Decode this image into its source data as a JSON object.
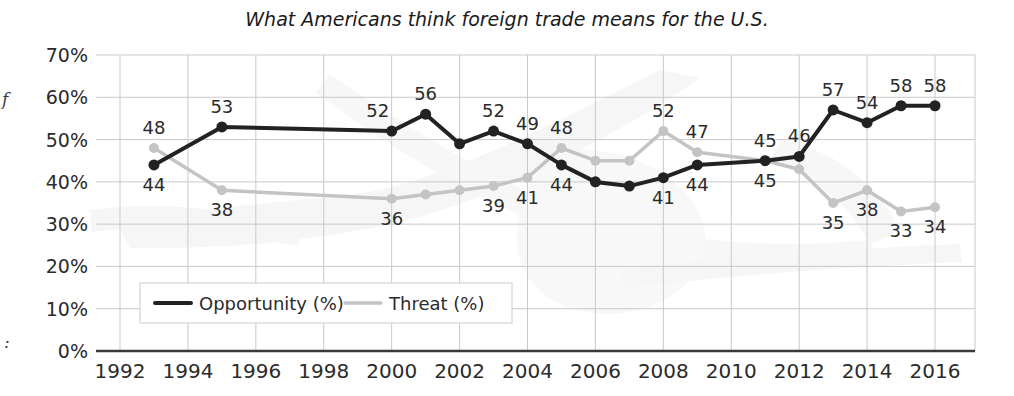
{
  "chart_data": {
    "type": "line",
    "title": "What Americans think foreign trade means for the U.S.",
    "xlabel": "",
    "ylabel": "",
    "xlim": [
      1992,
      2016
    ],
    "ylim": [
      0,
      70
    ],
    "grid": true,
    "legend_position": "bottom-left",
    "y_ticks": [
      "0%",
      "10%",
      "20%",
      "30%",
      "40%",
      "50%",
      "60%",
      "70%"
    ],
    "y_tick_values": [
      0,
      10,
      20,
      30,
      40,
      50,
      60,
      70
    ],
    "x_ticks": [
      "1992",
      "1994",
      "1996",
      "1998",
      "2000",
      "2002",
      "2004",
      "2006",
      "2008",
      "2010",
      "2012",
      "2014",
      "2016"
    ],
    "x_tick_values": [
      1992,
      1994,
      1996,
      1998,
      2000,
      2002,
      2004,
      2006,
      2008,
      2010,
      2012,
      2014,
      2016
    ],
    "series": [
      {
        "name": "Opportunity (%)",
        "color": "#222222",
        "points": [
          {
            "x": 1993,
            "y": 44,
            "label": "44",
            "label_pos": "below"
          },
          {
            "x": 1995,
            "y": 53,
            "label": "53",
            "label_pos": "above"
          },
          {
            "x": 2000,
            "y": 52,
            "label": "52",
            "label_pos": "above-left"
          },
          {
            "x": 2001,
            "y": 56,
            "label": "56",
            "label_pos": "above"
          },
          {
            "x": 2002,
            "y": 49,
            "label": "",
            "label_pos": "none"
          },
          {
            "x": 2003,
            "y": 52,
            "label": "52",
            "label_pos": "above"
          },
          {
            "x": 2004,
            "y": 49,
            "label": "49",
            "label_pos": "above"
          },
          {
            "x": 2005,
            "y": 44,
            "label": "44",
            "label_pos": "below"
          },
          {
            "x": 2006,
            "y": 40,
            "label": "",
            "label_pos": "none"
          },
          {
            "x": 2007,
            "y": 39,
            "label": "",
            "label_pos": "none"
          },
          {
            "x": 2008,
            "y": 41,
            "label": "41",
            "label_pos": "below"
          },
          {
            "x": 2009,
            "y": 44,
            "label": "44",
            "label_pos": "below"
          },
          {
            "x": 2011,
            "y": 45,
            "label": "45",
            "label_pos": "below"
          },
          {
            "x": 2012,
            "y": 46,
            "label": "46",
            "label_pos": "above"
          },
          {
            "x": 2013,
            "y": 57,
            "label": "57",
            "label_pos": "above"
          },
          {
            "x": 2014,
            "y": 54,
            "label": "54",
            "label_pos": "above"
          },
          {
            "x": 2015,
            "y": 58,
            "label": "58",
            "label_pos": "above"
          },
          {
            "x": 2016,
            "y": 58,
            "label": "58",
            "label_pos": "above"
          }
        ]
      },
      {
        "name": "Threat (%)",
        "color": "#c4c4c4",
        "points": [
          {
            "x": 1993,
            "y": 48,
            "label": "48",
            "label_pos": "above"
          },
          {
            "x": 1995,
            "y": 38,
            "label": "38",
            "label_pos": "below"
          },
          {
            "x": 2000,
            "y": 36,
            "label": "36",
            "label_pos": "below"
          },
          {
            "x": 2001,
            "y": 37,
            "label": "",
            "label_pos": "none"
          },
          {
            "x": 2002,
            "y": 38,
            "label": "",
            "label_pos": "none"
          },
          {
            "x": 2003,
            "y": 39,
            "label": "39",
            "label_pos": "below"
          },
          {
            "x": 2004,
            "y": 41,
            "label": "41",
            "label_pos": "below"
          },
          {
            "x": 2005,
            "y": 48,
            "label": "48",
            "label_pos": "above"
          },
          {
            "x": 2006,
            "y": 45,
            "label": "",
            "label_pos": "none"
          },
          {
            "x": 2007,
            "y": 45,
            "label": "",
            "label_pos": "none"
          },
          {
            "x": 2008,
            "y": 52,
            "label": "52",
            "label_pos": "above"
          },
          {
            "x": 2009,
            "y": 47,
            "label": "47",
            "label_pos": "above"
          },
          {
            "x": 2011,
            "y": 45,
            "label": "45",
            "label_pos": "above"
          },
          {
            "x": 2012,
            "y": 43,
            "label": "",
            "label_pos": "none"
          },
          {
            "x": 2013,
            "y": 35,
            "label": "35",
            "label_pos": "below"
          },
          {
            "x": 2014,
            "y": 38,
            "label": "38",
            "label_pos": "below"
          },
          {
            "x": 2015,
            "y": 33,
            "label": "33",
            "label_pos": "below"
          },
          {
            "x": 2016,
            "y": 34,
            "label": "34",
            "label_pos": "below"
          }
        ]
      }
    ]
  },
  "legend": {
    "items": [
      {
        "label": "Opportunity (%)",
        "color": "#222222"
      },
      {
        "label": "Threat (%)",
        "color": "#c4c4c4"
      }
    ]
  },
  "edge_artifacts": {
    "left_top": "f",
    "left_bottom": ":"
  }
}
